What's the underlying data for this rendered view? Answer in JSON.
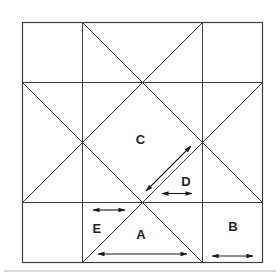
{
  "figure": {
    "canvas": {
      "width": 280,
      "height": 280,
      "background": "#ffffff"
    },
    "style": {
      "line_color": "#3e3e3e",
      "line_width": 1,
      "arrow_color": "#1a1a1a",
      "arrow_width": 1.1,
      "label_color": "#242424",
      "label_font_size": 13,
      "shadow_color": "#b5b5b5"
    },
    "square": {
      "x": 22.5,
      "y": 22.5,
      "size": 240
    },
    "grid_lines": [
      {
        "name": "vertical-grid-line-left",
        "x1": 82.5,
        "y1": 22.5,
        "x2": 82.5,
        "y2": 262.5
      },
      {
        "name": "vertical-grid-line-right",
        "x1": 202.5,
        "y1": 22.5,
        "x2": 202.5,
        "y2": 262.5
      },
      {
        "name": "horizontal-grid-line-top",
        "x1": 22.5,
        "y1": 82.5,
        "x2": 262.5,
        "y2": 82.5
      },
      {
        "name": "horizontal-grid-line-bottom",
        "x1": 22.5,
        "y1": 202.5,
        "x2": 262.5,
        "y2": 202.5
      }
    ],
    "diagonal_lines": [
      {
        "name": "diagonal-from-top-left-down-right",
        "x1": 82.5,
        "y1": 22.5,
        "x2": 262.5,
        "y2": 202.5
      },
      {
        "name": "diagonal-from-top-right-down-left",
        "x1": 202.5,
        "y1": 22.5,
        "x2": 22.5,
        "y2": 202.5
      },
      {
        "name": "diagonal-from-left-down-right",
        "x1": 22.5,
        "y1": 82.5,
        "x2": 202.5,
        "y2": 262.5
      },
      {
        "name": "diagonal-from-right-down-left",
        "x1": 262.5,
        "y1": 82.5,
        "x2": 82.5,
        "y2": 262.5
      }
    ],
    "labels": [
      {
        "name": "label-a",
        "text": "A",
        "x": 141,
        "y": 234.5
      },
      {
        "name": "label-b",
        "text": "B",
        "x": 233,
        "y": 226
      },
      {
        "name": "label-c",
        "text": "C",
        "x": 140.5,
        "y": 139
      },
      {
        "name": "label-d",
        "text": "D",
        "x": 186,
        "y": 181
      },
      {
        "name": "label-e",
        "text": "E",
        "x": 97,
        "y": 228
      }
    ],
    "arrows": [
      {
        "name": "double-arrow-under-a",
        "x1": 98,
        "y1": 254,
        "x2": 187,
        "y2": 254
      },
      {
        "name": "double-arrow-under-b",
        "x1": 212,
        "y1": 256,
        "x2": 253,
        "y2": 256
      },
      {
        "name": "double-arrow-under-d",
        "x1": 162,
        "y1": 193.5,
        "x2": 192,
        "y2": 193.5
      },
      {
        "name": "double-arrow-above-e",
        "x1": 93,
        "y1": 210,
        "x2": 125,
        "y2": 210
      },
      {
        "name": "double-arrow-diagonal-c",
        "x1": 146,
        "y1": 191,
        "x2": 191,
        "y2": 146
      }
    ],
    "scan_shadow": {
      "x1": 4,
      "y1": 271,
      "x2": 276,
      "y2": 271
    }
  }
}
